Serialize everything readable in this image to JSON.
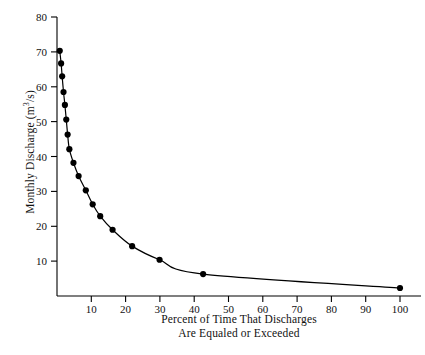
{
  "chart_data": {
    "type": "line",
    "title": "",
    "xlabel_line1": "Percent of Time That Discharges",
    "xlabel_line2": "Are Equaled or Exceeded",
    "ylabel_prefix": "Monthly Discharge (m",
    "ylabel_sup": "3",
    "ylabel_suffix": "/s)",
    "xlim": [
      0,
      103
    ],
    "ylim": [
      0,
      80
    ],
    "xticks": [
      10,
      20,
      30,
      40,
      50,
      60,
      70,
      80,
      90,
      100
    ],
    "yticks": [
      10,
      20,
      30,
      40,
      50,
      60,
      70,
      80
    ],
    "grid": false,
    "legend": "none",
    "markers": "filled-circle",
    "marker_color": "#000000",
    "line_color": "#000000",
    "x": [
      0.8,
      1.2,
      1.6,
      2.1,
      2.6,
      3.2,
      3.8,
      4.6,
      5.6,
      6.8,
      8.2,
      9.6,
      11.6,
      15.2,
      20.0,
      28.4,
      39.8,
      60.6,
      100.0
    ],
    "values": [
      70.3,
      66.7,
      63.0,
      58.5,
      54.8,
      50.6,
      46.3,
      42.1,
      38.2,
      34.4,
      30.3,
      26.3,
      22.9,
      19.0,
      14.3,
      10.4,
      6.3,
      2.3,
      2.3
    ],
    "series": [
      {
        "name": "Flow duration curve",
        "points": [
          {
            "x": 0.8,
            "y": 70.3
          },
          {
            "x": 1.2,
            "y": 66.7
          },
          {
            "x": 1.5,
            "y": 63.0
          },
          {
            "x": 1.9,
            "y": 58.5
          },
          {
            "x": 2.3,
            "y": 54.8
          },
          {
            "x": 2.7,
            "y": 50.6
          },
          {
            "x": 3.1,
            "y": 46.3
          },
          {
            "x": 3.6,
            "y": 42.1
          },
          {
            "x": 4.8,
            "y": 38.2
          },
          {
            "x": 6.3,
            "y": 34.4
          },
          {
            "x": 8.4,
            "y": 30.3
          },
          {
            "x": 10.4,
            "y": 26.3
          },
          {
            "x": 12.6,
            "y": 22.9
          },
          {
            "x": 16.2,
            "y": 19.0
          },
          {
            "x": 21.9,
            "y": 14.3
          },
          {
            "x": 29.9,
            "y": 10.4
          },
          {
            "x": 42.6,
            "y": 6.3
          },
          {
            "x": 100.0,
            "y": 2.3
          }
        ]
      }
    ]
  }
}
